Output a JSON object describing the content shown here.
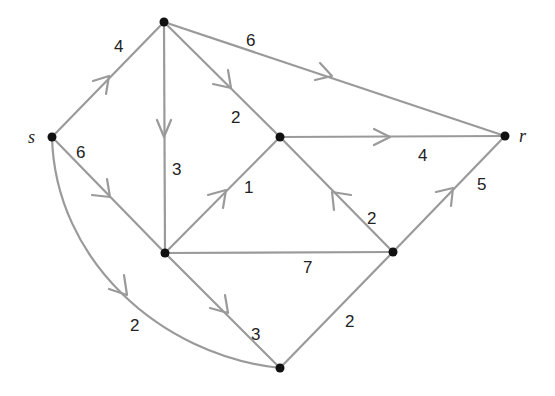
{
  "diagram": {
    "type": "directed weighted graph",
    "edge_color": "#9a9a9a",
    "node_color": "#111111",
    "nodes": [
      {
        "id": "s",
        "label": "s",
        "x": 52,
        "y": 137
      },
      {
        "id": "a",
        "label": "",
        "x": 164,
        "y": 22
      },
      {
        "id": "b",
        "label": "",
        "x": 165,
        "y": 253
      },
      {
        "id": "c",
        "label": "",
        "x": 280,
        "y": 137
      },
      {
        "id": "d",
        "label": "",
        "x": 393,
        "y": 252
      },
      {
        "id": "e",
        "label": "",
        "x": 280,
        "y": 368
      },
      {
        "id": "r",
        "label": "r",
        "x": 505,
        "y": 136
      }
    ],
    "edges": [
      {
        "from": "s",
        "to": "a",
        "weight": "4",
        "directed": true
      },
      {
        "from": "s",
        "to": "b",
        "weight": "6",
        "directed": true
      },
      {
        "from": "s",
        "to": "e",
        "weight": "2",
        "directed": true,
        "curved": true
      },
      {
        "from": "a",
        "to": "r",
        "weight": "6",
        "directed": true
      },
      {
        "from": "a",
        "to": "c",
        "weight": "2",
        "directed": true
      },
      {
        "from": "a",
        "to": "b",
        "weight": "3",
        "directed": true
      },
      {
        "from": "b",
        "to": "c",
        "weight": "1",
        "directed": true
      },
      {
        "from": "b",
        "to": "e",
        "weight": "3",
        "directed": true
      },
      {
        "from": "b",
        "to": "d",
        "weight": "7",
        "directed": false
      },
      {
        "from": "c",
        "to": "r",
        "weight": "4",
        "directed": true
      },
      {
        "from": "d",
        "to": "c",
        "weight": "2",
        "directed": true
      },
      {
        "from": "d",
        "to": "r",
        "weight": "5",
        "directed": true
      },
      {
        "from": "e",
        "to": "d",
        "weight": "2",
        "directed": false
      }
    ]
  },
  "labels": {
    "s": "s",
    "r": "r",
    "w_sa": "4",
    "w_sb": "6",
    "w_se": "2",
    "w_ar": "6",
    "w_ac": "2",
    "w_ab": "3",
    "w_bc": "1",
    "w_be": "3",
    "w_bd": "7",
    "w_cr": "4",
    "w_dc": "2",
    "w_dr": "5",
    "w_ed": "2"
  }
}
